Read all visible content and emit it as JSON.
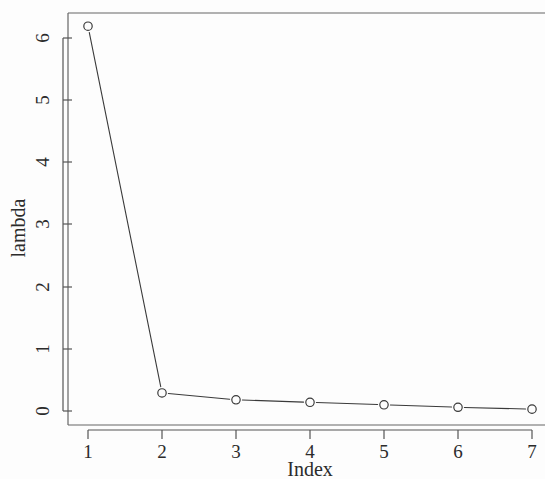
{
  "chart_data": {
    "type": "line",
    "title": "",
    "subtitle": "",
    "xlabel": "Index",
    "ylabel": "lambda",
    "x": [
      1,
      2,
      3,
      4,
      5,
      6,
      7
    ],
    "values": [
      6.19,
      0.29,
      0.18,
      0.14,
      0.1,
      0.06,
      0.03
    ],
    "series": [
      {
        "name": "lambda",
        "values": [
          6.19,
          0.29,
          0.18,
          0.14,
          0.1,
          0.06,
          0.03
        ]
      }
    ],
    "xtick_labels": [
      "1",
      "2",
      "3",
      "4",
      "5",
      "6",
      "7"
    ],
    "ytick_labels": [
      "0",
      "1",
      "2",
      "3",
      "4",
      "5",
      "6"
    ],
    "xticks": [
      1,
      2,
      3,
      4,
      5,
      6,
      7
    ],
    "yticks": [
      0,
      1,
      2,
      3,
      4,
      5,
      6
    ],
    "xlim": [
      0.73,
      7.27
    ],
    "ylim": [
      -0.09,
      6.62
    ],
    "grid": false,
    "legend": false,
    "legend_position": "none",
    "marker": "open-circle",
    "line_style": "solid",
    "point_line_style": "both",
    "colors": {
      "line": "#3a3a3a",
      "marker": "#3a3a3a",
      "axis": "#555555",
      "text": "#2b2b2b",
      "background": "#fdfdfd"
    },
    "annotations": []
  },
  "figure": {
    "width": 545,
    "height": 479
  }
}
